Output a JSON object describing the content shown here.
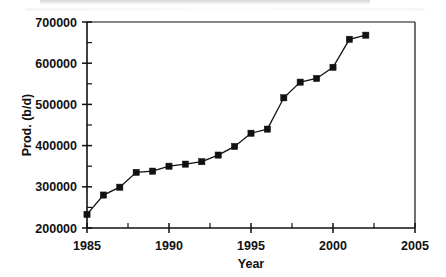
{
  "chart_data": {
    "type": "line",
    "title": "",
    "xlabel": "Year",
    "ylabel": "Prod. (b/d)",
    "xlim": [
      1985,
      2005
    ],
    "ylim": [
      200000,
      700000
    ],
    "grid": false,
    "legend": "none",
    "marker": "filled-square",
    "line_color": "#111111",
    "marker_color": "#111111",
    "x_ticks": [
      1985,
      1990,
      1995,
      2000,
      2005
    ],
    "x_tick_labels": [
      "1985",
      "1990",
      "1995",
      "2000",
      "2005"
    ],
    "x_minor_ticks": [
      1987.5,
      1992.5,
      1997.5,
      2002.5
    ],
    "y_ticks": [
      200000,
      300000,
      400000,
      500000,
      600000,
      700000
    ],
    "y_tick_labels": [
      "200000",
      "300000",
      "400000",
      "500000",
      "600000",
      "700000"
    ],
    "y_minor_ticks": [
      250000,
      350000,
      450000,
      550000,
      650000
    ],
    "x": [
      1985,
      1986,
      1987,
      1988,
      1989,
      1990,
      1991,
      1992,
      1993,
      1994,
      1995,
      1996,
      1997,
      1998,
      1999,
      2000,
      2001,
      2002
    ],
    "values": [
      233000,
      280000,
      299000,
      335000,
      338000,
      350000,
      355000,
      361000,
      377000,
      398000,
      430000,
      440000,
      516000,
      554000,
      563000,
      590000,
      658000,
      668000
    ],
    "series": [
      {
        "name": "Production",
        "x": [
          1985,
          1986,
          1987,
          1988,
          1989,
          1990,
          1991,
          1992,
          1993,
          1994,
          1995,
          1996,
          1997,
          1998,
          1999,
          2000,
          2001,
          2002
        ],
        "values": [
          233000,
          280000,
          299000,
          335000,
          338000,
          350000,
          355000,
          361000,
          377000,
          398000,
          430000,
          440000,
          516000,
          554000,
          563000,
          590000,
          658000,
          668000
        ]
      }
    ]
  }
}
